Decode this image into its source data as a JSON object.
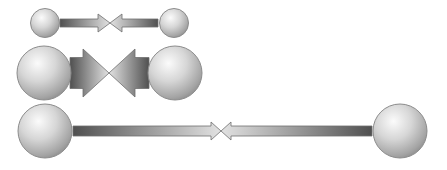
{
  "diagram": {
    "colors": {
      "background": "#ffffff",
      "sphere_highlight": "#fbfbfb",
      "sphere_mid": "#cfcfcf",
      "sphere_edge": "#8a8a8a",
      "sphere_outline": "#8c8c8c",
      "bar_dark": "#505050",
      "bar_light": "#e2e2e2",
      "bar_outline": "#6e6e6e"
    },
    "pairs": [
      {
        "name": "small-pair",
        "left_sphere": {
          "cx": 45,
          "cy": 23,
          "r": 14.5
        },
        "right_sphere": {
          "cx": 174,
          "cy": 23,
          "r": 14.5
        },
        "bar": {
          "x1": 60,
          "x2": 158,
          "cy": 23,
          "thickness": 8
        },
        "meet_x": 110,
        "head": {
          "length": 12,
          "half_height": 9
        }
      },
      {
        "name": "medium-pair",
        "left_sphere": {
          "cx": 44,
          "cy": 73,
          "r": 27
        },
        "right_sphere": {
          "cx": 175,
          "cy": 73,
          "r": 27
        },
        "bar": {
          "x1": 70,
          "x2": 149,
          "cy": 73,
          "thickness": 31
        },
        "meet_x": 109,
        "head": {
          "length": 26,
          "half_height": 24
        }
      },
      {
        "name": "long-pair",
        "left_sphere": {
          "cx": 45,
          "cy": 131,
          "r": 27
        },
        "right_sphere": {
          "cx": 400,
          "cy": 131,
          "r": 27
        },
        "bar": {
          "x1": 73,
          "x2": 372,
          "cy": 131,
          "thickness": 10
        },
        "meet_x": 221,
        "head": {
          "length": 10,
          "half_height": 9
        }
      }
    ]
  }
}
